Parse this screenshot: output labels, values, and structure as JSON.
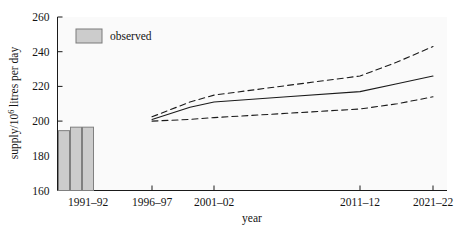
{
  "chart_data": {
    "type": "line",
    "title": "",
    "xlabel": "year",
    "ylabel": "supply/10^6 litres per day",
    "ylabel_prefix": "supply/10",
    "ylabel_exponent": "6",
    "ylabel_suffix": " litres per day",
    "ylim": [
      160,
      260
    ],
    "yticks": [
      160,
      180,
      200,
      220,
      240,
      260
    ],
    "ytick_labels": [
      "160",
      "180",
      "200",
      "220",
      "240",
      "260"
    ],
    "xticks": [
      "1991-92",
      "1996-97",
      "2001-02",
      "2011-12",
      "2021-22"
    ],
    "xtick_labels": [
      "1991–92",
      "1996–97",
      "2001–02",
      "2011–12",
      "2021–22"
    ],
    "grid": false,
    "legend_position": "top-left",
    "legend": [
      {
        "name": "observed",
        "style": "filled-bar",
        "color": "#cccccc"
      }
    ],
    "series": [
      {
        "name": "observed",
        "type": "bar",
        "color": "#cccccc",
        "categories": [
          "1989-90",
          "1990-91",
          "1991-92"
        ],
        "values": [
          194.5,
          196.5,
          196.5
        ]
      },
      {
        "name": "forecast",
        "type": "line",
        "style": "solid",
        "color": "#1a1a1a",
        "x": [
          "1996-97",
          "1999-00",
          "2001-02",
          "2006-07",
          "2011-12",
          "2016-17",
          "2021-22"
        ],
        "values": [
          201,
          208,
          211,
          214,
          217,
          221.5,
          226
        ]
      },
      {
        "name": "upper-bound",
        "type": "line",
        "style": "dashed",
        "color": "#1a1a1a",
        "x": [
          "1996-97",
          "1999-00",
          "2001-02",
          "2006-07",
          "2011-12",
          "2016-17",
          "2021-22"
        ],
        "values": [
          202.5,
          211,
          215,
          220.5,
          226,
          234,
          243
        ]
      },
      {
        "name": "lower-bound",
        "type": "line",
        "style": "dashed",
        "color": "#1a1a1a",
        "x": [
          "1996-97",
          "1999-00",
          "2001-02",
          "2006-07",
          "2011-12",
          "2016-17",
          "2021-22"
        ],
        "values": [
          200,
          201,
          202,
          204.5,
          207,
          210,
          214
        ]
      }
    ],
    "annotations": []
  },
  "colors": {
    "plot_background": "#fafafa",
    "page_background": "#ffffff",
    "axis": "#1a1a1a",
    "bar_fill": "#cccccc",
    "bar_stroke": "#808080",
    "line": "#1a1a1a"
  }
}
